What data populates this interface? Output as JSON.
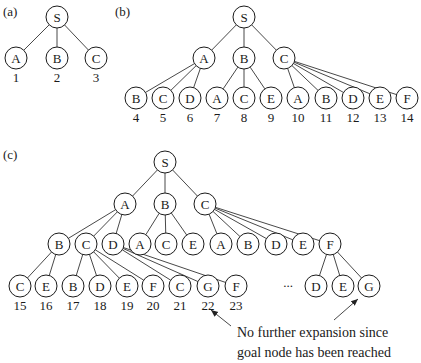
{
  "node_radius": 11,
  "colors": {
    "stroke": "#1a1a1a",
    "edge": "#333333",
    "background": "#ffffff"
  },
  "panels": [
    {
      "label": "(a)",
      "label_pos": [
        3,
        16
      ],
      "nodes": [
        {
          "id": "a_S",
          "label": "S",
          "x": 57,
          "y": 17
        },
        {
          "id": "a_A",
          "label": "A",
          "x": 16,
          "y": 58,
          "order": "1"
        },
        {
          "id": "a_B",
          "label": "B",
          "x": 57,
          "y": 58,
          "order": "2"
        },
        {
          "id": "a_C",
          "label": "C",
          "x": 96,
          "y": 58,
          "order": "3"
        }
      ],
      "edges": [
        [
          "a_S",
          "a_A"
        ],
        [
          "a_S",
          "a_B"
        ],
        [
          "a_S",
          "a_C"
        ]
      ]
    },
    {
      "label": "(b)",
      "label_pos": [
        115,
        16
      ],
      "nodes": [
        {
          "id": "b_S",
          "label": "S",
          "x": 244,
          "y": 17
        },
        {
          "id": "b_A",
          "label": "A",
          "x": 204,
          "y": 58
        },
        {
          "id": "b_B",
          "label": "B",
          "x": 244,
          "y": 58
        },
        {
          "id": "b_C",
          "label": "C",
          "x": 284,
          "y": 58
        },
        {
          "id": "b_AB",
          "label": "B",
          "x": 136,
          "y": 98,
          "order": "4"
        },
        {
          "id": "b_AC",
          "label": "C",
          "x": 163,
          "y": 98,
          "order": "5"
        },
        {
          "id": "b_AD",
          "label": "D",
          "x": 190,
          "y": 98,
          "order": "6"
        },
        {
          "id": "b_BA",
          "label": "A",
          "x": 217,
          "y": 98,
          "order": "7"
        },
        {
          "id": "b_BC",
          "label": "C",
          "x": 244,
          "y": 98,
          "order": "8"
        },
        {
          "id": "b_BE",
          "label": "E",
          "x": 271,
          "y": 98,
          "order": "9"
        },
        {
          "id": "b_CA",
          "label": "A",
          "x": 298,
          "y": 98,
          "order": "10"
        },
        {
          "id": "b_CB",
          "label": "B",
          "x": 326,
          "y": 98,
          "order": "11"
        },
        {
          "id": "b_CD",
          "label": "D",
          "x": 353,
          "y": 98,
          "order": "12"
        },
        {
          "id": "b_CE",
          "label": "E",
          "x": 380,
          "y": 98,
          "order": "13"
        },
        {
          "id": "b_CF",
          "label": "F",
          "x": 407,
          "y": 98,
          "order": "14"
        }
      ],
      "edges": [
        [
          "b_S",
          "b_A"
        ],
        [
          "b_S",
          "b_B"
        ],
        [
          "b_S",
          "b_C"
        ],
        [
          "b_A",
          "b_AB"
        ],
        [
          "b_A",
          "b_AC"
        ],
        [
          "b_A",
          "b_AD"
        ],
        [
          "b_B",
          "b_BA"
        ],
        [
          "b_B",
          "b_BC"
        ],
        [
          "b_B",
          "b_BE"
        ],
        [
          "b_C",
          "b_CA"
        ],
        [
          "b_C",
          "b_CB"
        ],
        [
          "b_C",
          "b_CD"
        ],
        [
          "b_C",
          "b_CE"
        ],
        [
          "b_C",
          "b_CF"
        ]
      ]
    },
    {
      "label": "(c)",
      "label_pos": [
        3,
        159
      ],
      "nodes": [
        {
          "id": "c_S",
          "label": "S",
          "x": 165,
          "y": 162
        },
        {
          "id": "c_A",
          "label": "A",
          "x": 125,
          "y": 204
        },
        {
          "id": "c_B",
          "label": "B",
          "x": 165,
          "y": 204
        },
        {
          "id": "c_C",
          "label": "C",
          "x": 205,
          "y": 204
        },
        {
          "id": "c_AB",
          "label": "B",
          "x": 59,
          "y": 244
        },
        {
          "id": "c_AC",
          "label": "C",
          "x": 86,
          "y": 244
        },
        {
          "id": "c_AD",
          "label": "D",
          "x": 113,
          "y": 244
        },
        {
          "id": "c_BA",
          "label": "A",
          "x": 140,
          "y": 244
        },
        {
          "id": "c_BC",
          "label": "C",
          "x": 166,
          "y": 244
        },
        {
          "id": "c_BE",
          "label": "E",
          "x": 193,
          "y": 244
        },
        {
          "id": "c_CA",
          "label": "A",
          "x": 221,
          "y": 244
        },
        {
          "id": "c_CB",
          "label": "B",
          "x": 248,
          "y": 244
        },
        {
          "id": "c_CD",
          "label": "D",
          "x": 276,
          "y": 244
        },
        {
          "id": "c_CE",
          "label": "E",
          "x": 303,
          "y": 244
        },
        {
          "id": "c_CF",
          "label": "F",
          "x": 330,
          "y": 244
        },
        {
          "id": "c_ABC",
          "label": "C",
          "x": 20,
          "y": 286,
          "order": "15"
        },
        {
          "id": "c_ABE",
          "label": "E",
          "x": 46,
          "y": 286,
          "order": "16"
        },
        {
          "id": "c_ACB",
          "label": "B",
          "x": 73,
          "y": 286,
          "order": "17"
        },
        {
          "id": "c_ACD",
          "label": "D",
          "x": 100,
          "y": 286,
          "order": "18"
        },
        {
          "id": "c_ACE",
          "label": "E",
          "x": 127,
          "y": 286,
          "order": "19"
        },
        {
          "id": "c_ACF",
          "label": "F",
          "x": 153,
          "y": 286,
          "order": "20"
        },
        {
          "id": "c_ADC",
          "label": "C",
          "x": 180,
          "y": 286,
          "order": "21"
        },
        {
          "id": "c_ADG",
          "label": "G",
          "x": 208,
          "y": 286,
          "order": "22"
        },
        {
          "id": "c_ADF",
          "label": "F",
          "x": 236,
          "y": 286,
          "order": "23"
        },
        {
          "id": "c_CFD",
          "label": "D",
          "x": 316,
          "y": 286
        },
        {
          "id": "c_CFE",
          "label": "E",
          "x": 343,
          "y": 286
        },
        {
          "id": "c_CFG",
          "label": "G",
          "x": 369,
          "y": 286
        }
      ],
      "edges": [
        [
          "c_S",
          "c_A"
        ],
        [
          "c_S",
          "c_B"
        ],
        [
          "c_S",
          "c_C"
        ],
        [
          "c_A",
          "c_AB"
        ],
        [
          "c_A",
          "c_AC"
        ],
        [
          "c_A",
          "c_AD"
        ],
        [
          "c_B",
          "c_BA"
        ],
        [
          "c_B",
          "c_BC"
        ],
        [
          "c_B",
          "c_BE"
        ],
        [
          "c_C",
          "c_CA"
        ],
        [
          "c_C",
          "c_CB"
        ],
        [
          "c_C",
          "c_CD"
        ],
        [
          "c_C",
          "c_CE"
        ],
        [
          "c_C",
          "c_CF"
        ],
        [
          "c_AB",
          "c_ABC"
        ],
        [
          "c_AB",
          "c_ABE"
        ],
        [
          "c_AC",
          "c_ACB"
        ],
        [
          "c_AC",
          "c_ACD"
        ],
        [
          "c_AC",
          "c_ACE"
        ],
        [
          "c_AC",
          "c_ACF"
        ],
        [
          "c_AD",
          "c_ADC"
        ],
        [
          "c_AD",
          "c_ADG"
        ],
        [
          "c_AD",
          "c_ADF"
        ],
        [
          "c_CF",
          "c_CFD"
        ],
        [
          "c_CF",
          "c_CFE"
        ],
        [
          "c_CF",
          "c_CFG"
        ]
      ],
      "ellipsis": {
        "text": "...",
        "x": 288,
        "y": 287
      },
      "annotation": {
        "lines": [
          "No further expansion since",
          "goal node has been reached"
        ],
        "x": 237,
        "y1": 337,
        "y2": 357,
        "arrows": [
          {
            "from": [
              231,
              326
            ],
            "to": [
              211,
              310
            ]
          },
          {
            "from": [
              334,
              320
            ],
            "to": [
              358,
              299
            ]
          }
        ]
      }
    }
  ]
}
